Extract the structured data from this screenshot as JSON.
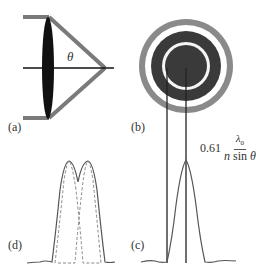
{
  "panels": {
    "a": {
      "label": "(a)",
      "angle_symbol": "θ",
      "description": "lens focusing light to a point"
    },
    "b": {
      "label": "(b)",
      "description": "Airy disk pattern"
    },
    "c": {
      "label": "(c)",
      "description": "intensity profile of single Airy disk"
    },
    "d": {
      "label": "(d)",
      "description": "two overlapping Airy profiles (Rayleigh criterion)"
    }
  },
  "formula": {
    "coefficient": "0.61",
    "numerator_symbol": "λ",
    "numerator_subscript": "0",
    "denominator_n": "n",
    "denominator_func": "sin",
    "denominator_angle": "θ"
  },
  "colors": {
    "beam": "#808080",
    "lens": "#111111",
    "ring_dark": "#3a3a3a",
    "ring_outer": "#8a8a8a",
    "line": "#222222",
    "curve": "#555555",
    "dashed": "#888888"
  }
}
